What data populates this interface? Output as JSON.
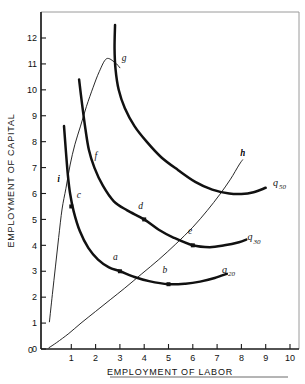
{
  "figure": {
    "name": "isoquant-map",
    "footer_rule": true
  },
  "chart_data": {
    "type": "line",
    "title": "",
    "xlabel": "EMPLOYMENT OF LABOR",
    "ylabel": "EMPLOYMENT OF CAPITAL",
    "xlim": [
      0,
      10
    ],
    "ylim": [
      0,
      12.6
    ],
    "xticks": [
      0,
      1,
      2,
      3,
      4,
      5,
      6,
      7,
      8,
      9,
      10
    ],
    "yticks": [
      0,
      1,
      2,
      3,
      4,
      5,
      6,
      7,
      8,
      9,
      10,
      11,
      12
    ],
    "xtick_labels": [
      "0",
      "1",
      "2",
      "3",
      "4",
      "5",
      "6",
      "7",
      "8",
      "9",
      "10"
    ],
    "ytick_labels": [
      "0",
      "1",
      "2",
      "3",
      "4",
      "5",
      "6",
      "7",
      "8",
      "9",
      "10",
      "11",
      "12"
    ],
    "grid": false,
    "legend": "none",
    "series": [
      {
        "name": "q20",
        "label": "q",
        "label_sub": "20",
        "label_x": 7.2,
        "label_y": 2.95,
        "style": "thick",
        "points": [
          [
            0.7,
            8.6
          ],
          [
            0.78,
            7.6
          ],
          [
            0.86,
            6.7
          ],
          [
            0.95,
            6.0
          ],
          [
            1.1,
            5.3
          ],
          [
            1.35,
            4.55
          ],
          [
            1.7,
            3.9
          ],
          [
            2.1,
            3.45
          ],
          [
            2.55,
            3.15
          ],
          [
            3.0,
            3.0
          ],
          [
            3.6,
            2.78
          ],
          [
            4.2,
            2.62
          ],
          [
            5.0,
            2.5
          ],
          [
            5.7,
            2.52
          ],
          [
            6.3,
            2.6
          ],
          [
            6.9,
            2.74
          ],
          [
            7.4,
            2.9
          ]
        ]
      },
      {
        "name": "q30",
        "label": "q",
        "label_sub": "30",
        "label_x": 8.25,
        "label_y": 4.2,
        "style": "thick",
        "points": [
          [
            1.32,
            10.4
          ],
          [
            1.45,
            9.4
          ],
          [
            1.58,
            8.5
          ],
          [
            1.72,
            7.7
          ],
          [
            1.95,
            7.0
          ],
          [
            2.3,
            6.3
          ],
          [
            2.75,
            5.7
          ],
          [
            3.3,
            5.35
          ],
          [
            4.0,
            5.0
          ],
          [
            4.6,
            4.6
          ],
          [
            5.2,
            4.3
          ],
          [
            6.0,
            4.0
          ],
          [
            6.7,
            3.93
          ],
          [
            7.3,
            4.0
          ],
          [
            7.9,
            4.12
          ],
          [
            8.2,
            4.22
          ]
        ]
      },
      {
        "name": "q50",
        "label": "q",
        "label_sub": "50",
        "label_x": 9.3,
        "label_y": 6.3,
        "style": "thick",
        "points": [
          [
            2.8,
            12.5
          ],
          [
            2.78,
            11.6
          ],
          [
            2.82,
            10.8
          ],
          [
            2.95,
            10.0
          ],
          [
            3.2,
            9.3
          ],
          [
            3.6,
            8.6
          ],
          [
            4.1,
            8.0
          ],
          [
            4.7,
            7.4
          ],
          [
            5.4,
            6.9
          ],
          [
            6.1,
            6.45
          ],
          [
            6.8,
            6.15
          ],
          [
            7.5,
            6.0
          ],
          [
            8.0,
            5.98
          ],
          [
            8.5,
            6.05
          ],
          [
            9.0,
            6.22
          ]
        ]
      },
      {
        "name": "expansion-path",
        "label": "h",
        "label_x": 7.95,
        "label_y": 7.45,
        "style": "thin",
        "points": [
          [
            0.08,
            0.05
          ],
          [
            0.4,
            0.25
          ],
          [
            0.9,
            0.6
          ],
          [
            1.4,
            1.0
          ],
          [
            2.0,
            1.45
          ],
          [
            2.6,
            1.9
          ],
          [
            3.2,
            2.35
          ],
          [
            3.9,
            2.9
          ],
          [
            4.6,
            3.45
          ],
          [
            5.3,
            4.05
          ],
          [
            6.0,
            4.7
          ],
          [
            6.6,
            5.35
          ],
          [
            7.1,
            5.95
          ],
          [
            7.55,
            6.55
          ],
          [
            7.9,
            7.1
          ],
          [
            8.05,
            7.3
          ]
        ]
      },
      {
        "name": "ridge-line",
        "label": "i",
        "label_x": 0.42,
        "label_y": 6.45,
        "style": "thin",
        "points": [
          [
            0.1,
            1.05
          ],
          [
            0.22,
            2.1
          ],
          [
            0.35,
            3.2
          ],
          [
            0.48,
            4.3
          ],
          [
            0.62,
            5.4
          ],
          [
            0.78,
            6.2
          ],
          [
            0.95,
            7.1
          ],
          [
            1.15,
            7.9
          ],
          [
            1.38,
            8.6
          ],
          [
            1.62,
            9.35
          ],
          [
            1.9,
            10.1
          ],
          [
            2.15,
            10.7
          ],
          [
            2.45,
            11.2
          ],
          [
            2.8,
            11.05
          ],
          [
            3.0,
            10.85
          ]
        ]
      }
    ],
    "points": [
      {
        "id": "a",
        "x": 3.0,
        "y": 3.0,
        "label": "a",
        "lx": 2.72,
        "ly": 3.42,
        "marker": true
      },
      {
        "id": "b",
        "x": 5.0,
        "y": 2.5,
        "label": "b",
        "lx": 4.75,
        "ly": 2.95,
        "marker": true
      },
      {
        "id": "c",
        "x": 1.0,
        "y": 5.5,
        "label": "c",
        "lx": 1.22,
        "ly": 5.82,
        "marker": true
      },
      {
        "id": "d",
        "x": 4.0,
        "y": 5.0,
        "label": "d",
        "lx": 3.75,
        "ly": 5.42,
        "marker": true
      },
      {
        "id": "e",
        "x": 6.0,
        "y": 4.0,
        "label": "e",
        "lx": 5.8,
        "ly": 4.42,
        "marker": true
      },
      {
        "id": "f",
        "x": 1.95,
        "y": 7.0,
        "label": "f",
        "lx": 1.95,
        "ly": 7.35,
        "marker": false
      },
      {
        "id": "g",
        "x": 2.85,
        "y": 10.9,
        "label": "g",
        "lx": 3.08,
        "ly": 11.12,
        "marker": false
      },
      {
        "id": "h",
        "x": 7.95,
        "y": 7.45,
        "label": "h",
        "lx": 7.95,
        "ly": 7.45,
        "marker": false
      },
      {
        "id": "i",
        "x": 0.7,
        "y": 6.25,
        "label": "i",
        "lx": 0.42,
        "ly": 6.45,
        "marker": false
      }
    ]
  }
}
